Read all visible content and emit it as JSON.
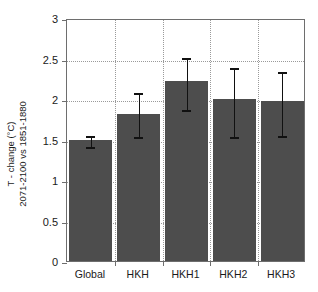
{
  "chart_data": {
    "type": "bar",
    "title": "",
    "xlabel": "",
    "ylabel_line1": "T - change (°C)",
    "ylabel_line2": "2071-2100 vs 1851-1880",
    "categories": [
      "Global",
      "HKH",
      "HKH1",
      "HKH2",
      "HKH3"
    ],
    "values": [
      1.5,
      1.82,
      2.22,
      2.0,
      1.98
    ],
    "error_low": [
      1.43,
      1.55,
      1.89,
      1.55,
      1.57
    ],
    "error_high": [
      1.57,
      2.1,
      2.53,
      2.41,
      2.36
    ],
    "ylim": [
      0,
      3
    ],
    "ytick_values": [
      0,
      0.5,
      1,
      1.5,
      2,
      2.5,
      3
    ],
    "ytick_labels": [
      "0",
      "0.5",
      "1",
      "1.5",
      "2",
      "2.5",
      "3"
    ],
    "grid": true,
    "grid_style": "dotted",
    "legend": "none",
    "bar_color": "#4d4d4d",
    "error_color": "#111111",
    "axis_color": "#6e6e6e",
    "grid_color": "#9a9a9a",
    "background": "#ffffff"
  }
}
